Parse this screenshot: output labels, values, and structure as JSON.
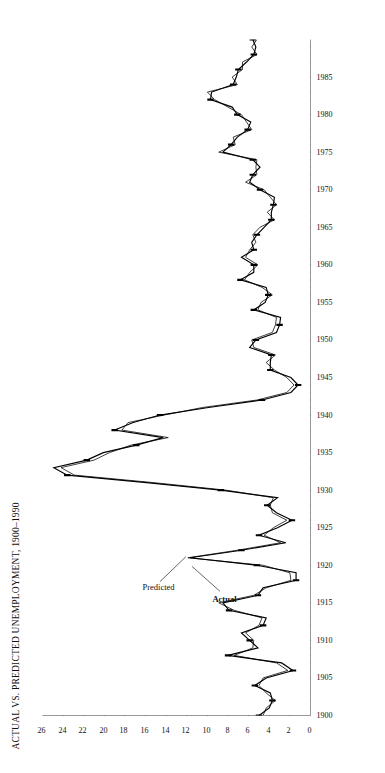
{
  "figure": {
    "title": "ACTUAL VS. PREDICTED UNEMPLOYMENT, 1900–1990",
    "y_axis_title": "Unemployment Rate",
    "annotation_actual": "Actual",
    "annotation_predicted": "Predicted",
    "ink_color": "#000000",
    "background_color": "#ffffff"
  },
  "chart_data": {
    "type": "line",
    "title": "ACTUAL VS. PREDICTED UNEMPLOYMENT, 1900–1990",
    "xlabel": "",
    "ylabel": "Unemployment Rate",
    "xlim": [
      1900,
      1990
    ],
    "ylim": [
      0,
      26
    ],
    "grid": false,
    "legend_position": "inline-annotations",
    "x_major_ticks": [
      1900,
      1905,
      1910,
      1915,
      1920,
      1925,
      1930,
      1935,
      1940,
      1945,
      1950,
      1955,
      1960,
      1965,
      1970,
      1975,
      1980,
      1985
    ],
    "x_major_tick_labels": [
      "1900",
      "1905",
      "1910",
      "1915",
      "1920",
      "1925",
      "1930",
      "1935",
      "1940",
      "1945",
      "1950",
      "1955",
      "1960",
      "1965",
      "1970",
      "1975",
      "1980",
      "1985"
    ],
    "x_minor_tick_step": 1,
    "y_ticks": [
      0,
      2,
      4,
      6,
      8,
      10,
      12,
      14,
      16,
      18,
      20,
      22,
      24,
      26
    ],
    "y_tick_labels": [
      "0",
      "2",
      "4",
      "6",
      "8",
      "10",
      "12",
      "14",
      "16",
      "18",
      "20",
      "22",
      "24",
      "26"
    ],
    "x": [
      1900,
      1901,
      1902,
      1903,
      1904,
      1905,
      1906,
      1907,
      1908,
      1909,
      1910,
      1911,
      1912,
      1913,
      1914,
      1915,
      1916,
      1917,
      1918,
      1919,
      1920,
      1921,
      1922,
      1923,
      1924,
      1925,
      1926,
      1927,
      1928,
      1929,
      1930,
      1931,
      1932,
      1933,
      1934,
      1935,
      1936,
      1937,
      1938,
      1939,
      1940,
      1941,
      1942,
      1943,
      1944,
      1945,
      1946,
      1947,
      1948,
      1949,
      1950,
      1951,
      1952,
      1953,
      1954,
      1955,
      1956,
      1957,
      1958,
      1959,
      1960,
      1961,
      1962,
      1963,
      1964,
      1965,
      1966,
      1967,
      1968,
      1969,
      1970,
      1971,
      1972,
      1973,
      1974,
      1975,
      1976,
      1977,
      1978,
      1979,
      1980,
      1981,
      1982,
      1983,
      1984,
      1985,
      1986,
      1987,
      1988,
      1989,
      1990
    ],
    "series": [
      {
        "name": "Actual",
        "style": "heavy",
        "values": [
          5.0,
          4.0,
          3.7,
          3.9,
          5.4,
          4.3,
          1.7,
          2.8,
          8.0,
          5.1,
          5.9,
          6.7,
          4.6,
          4.3,
          7.9,
          8.5,
          5.1,
          4.6,
          1.4,
          1.4,
          5.2,
          11.7,
          6.7,
          2.4,
          5.0,
          3.2,
          1.8,
          3.3,
          4.2,
          3.2,
          8.7,
          15.9,
          23.6,
          24.9,
          21.7,
          20.1,
          16.9,
          14.3,
          19.0,
          17.2,
          14.6,
          9.9,
          4.7,
          1.9,
          1.2,
          1.9,
          3.9,
          3.9,
          3.8,
          5.9,
          5.3,
          3.3,
          3.0,
          2.9,
          5.5,
          4.4,
          4.1,
          4.3,
          6.8,
          5.5,
          5.5,
          6.7,
          5.5,
          5.7,
          5.2,
          4.5,
          3.8,
          3.8,
          3.6,
          3.5,
          4.9,
          5.9,
          5.6,
          4.9,
          5.6,
          8.5,
          7.7,
          7.1,
          6.1,
          5.8,
          7.1,
          7.6,
          9.7,
          9.6,
          7.5,
          7.2,
          7.0,
          6.2,
          5.5,
          5.3,
          5.6
        ]
      },
      {
        "name": "Predicted",
        "style": "light",
        "values": [
          4.6,
          4.3,
          3.4,
          4.3,
          5.0,
          4.6,
          2.2,
          3.3,
          7.4,
          5.6,
          5.5,
          6.3,
          5.0,
          4.7,
          7.4,
          8.9,
          5.5,
          4.3,
          1.9,
          2.0,
          4.6,
          11.9,
          7.1,
          2.9,
          4.5,
          3.6,
          2.3,
          3.7,
          3.9,
          3.6,
          8.2,
          15.2,
          22.9,
          24.2,
          21.0,
          19.5,
          17.4,
          13.8,
          18.3,
          17.7,
          14.2,
          10.5,
          5.2,
          2.3,
          1.6,
          2.3,
          3.5,
          4.3,
          3.4,
          5.5,
          5.7,
          3.7,
          3.4,
          3.3,
          5.1,
          4.8,
          3.7,
          4.7,
          6.4,
          5.9,
          5.1,
          6.3,
          5.9,
          5.3,
          5.6,
          4.9,
          3.5,
          4.2,
          3.3,
          3.9,
          4.5,
          6.3,
          5.2,
          5.3,
          5.2,
          8.9,
          7.3,
          7.5,
          5.7,
          6.2,
          6.7,
          8.0,
          9.3,
          10.0,
          7.1,
          7.6,
          6.6,
          6.6,
          5.2,
          5.7,
          5.2
        ]
      }
    ],
    "annotations": [
      {
        "text": "Actual",
        "at_x": 1920,
        "at_y": 11.7,
        "style": "bold"
      },
      {
        "text": "Predicted",
        "at_x": 1921,
        "at_y": 11.9,
        "style": "regular"
      }
    ]
  }
}
